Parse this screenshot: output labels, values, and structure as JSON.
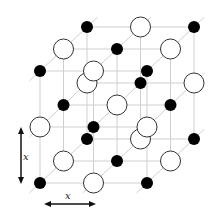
{
  "diagram": {
    "title": "",
    "grid_size": [
      3,
      3,
      3
    ],
    "colors": {
      "line": "#cfcfcf",
      "small_atom_fill": "#000000",
      "large_atom_fill": "#ffffff",
      "large_atom_stroke": "#333333",
      "arrow": "#111111"
    },
    "geometry": {
      "origin": [
        40,
        183
      ],
      "step_x": 53.5,
      "step_y": -56,
      "depth_step": [
        23.5,
        -22
      ],
      "small_radius": 6,
      "large_radius": 10
    },
    "dimension_labels": {
      "vertical": "x",
      "horizontal": "x"
    }
  }
}
